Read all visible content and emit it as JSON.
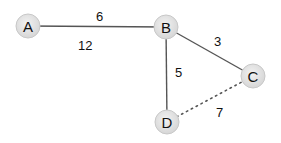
{
  "graph": {
    "nodes": [
      {
        "id": "A",
        "label": "A",
        "x": 28,
        "y": 26
      },
      {
        "id": "B",
        "label": "B",
        "x": 166,
        "y": 27
      },
      {
        "id": "C",
        "label": "C",
        "x": 253,
        "y": 76
      },
      {
        "id": "D",
        "label": "D",
        "x": 167,
        "y": 122
      }
    ],
    "edges": [
      {
        "from": "A",
        "to": "B",
        "weight": "6",
        "style": "solid",
        "label_x": 96,
        "label_y": 21
      },
      {
        "from": "B",
        "to": "C",
        "weight": "3",
        "style": "solid",
        "label_x": 214,
        "label_y": 46
      },
      {
        "from": "B",
        "to": "D",
        "weight": "5",
        "style": "solid",
        "label_x": 175,
        "label_y": 77
      },
      {
        "from": "D",
        "to": "C",
        "weight": "7",
        "style": "dotted",
        "label_x": 216,
        "label_y": 117
      }
    ],
    "floating_labels": [
      {
        "text": "12",
        "x": 78,
        "y": 50
      }
    ],
    "colors": {
      "node_fill": "#e2e2e2",
      "node_stroke": "#c8c8c8",
      "edge": "#555555",
      "text": "#111111"
    }
  }
}
